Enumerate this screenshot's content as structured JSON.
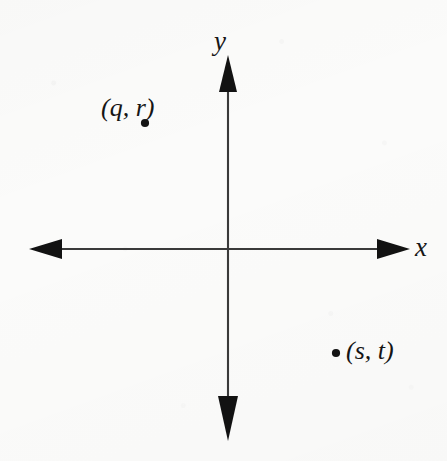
{
  "figure": {
    "type": "coordinate-plane-diagram",
    "background_color": "#fbfbfa",
    "ink_color": "#161616",
    "width": 447,
    "height": 461
  },
  "axes": {
    "origin": {
      "x": 228,
      "y": 249
    },
    "x_axis": {
      "label": "x",
      "label_position": {
        "x": 415,
        "y": 234
      },
      "left_tip": {
        "x": 29,
        "y": 249
      },
      "right_tip": {
        "x": 410,
        "y": 249
      },
      "arrow_both_ends": true
    },
    "y_axis": {
      "label": "y",
      "label_position": {
        "x": 214,
        "y": 28
      },
      "top_tip": {
        "x": 228,
        "y": 55
      },
      "bottom_tip": {
        "x": 228,
        "y": 440
      },
      "arrow_both_ends": true
    }
  },
  "points": [
    {
      "label": "(q, r)",
      "quadrant": "II",
      "dot": {
        "x": 145,
        "y": 123
      },
      "label_position": {
        "x": 101,
        "y": 95
      },
      "label_anchor": "above-left-of-dot"
    },
    {
      "label": "(s, t)",
      "quadrant": "IV",
      "dot": {
        "x": 336,
        "y": 353
      },
      "label_position": {
        "x": 346,
        "y": 338
      },
      "label_anchor": "right-of-dot"
    }
  ]
}
